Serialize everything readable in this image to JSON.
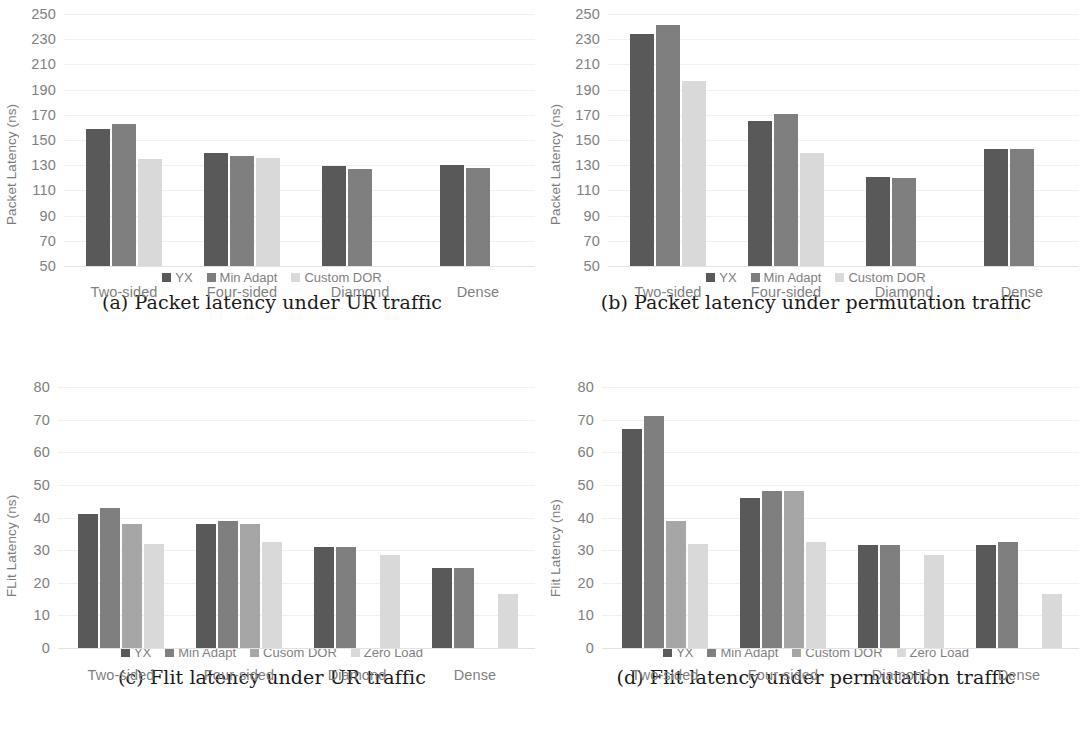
{
  "colors": {
    "yx": "#595959",
    "min_adapt": "#7f7f7f",
    "custom_dor": "#d9d9d9",
    "zero_load": "#d9d9d9",
    "cusom_dor_c": "#a6a6a6",
    "custom_dor_d": "#a6a6a6",
    "grid": "#f0f0f0",
    "tick_text": "#808080",
    "caption_text": "#1a1a1a"
  },
  "panels": [
    {
      "id": "panel-a",
      "caption": "(a) Packet latency under UR traffic",
      "chart_data": {
        "type": "bar",
        "title": "",
        "xlabel": "",
        "ylabel": "Packet Latency (ns)",
        "ylim": [
          50,
          250
        ],
        "ytick_step": 20,
        "yticks": [
          250,
          230,
          210,
          190,
          170,
          150,
          130,
          110,
          90,
          70,
          50
        ],
        "grid": true,
        "legend_position": "bottom",
        "categories": [
          "Two-sided",
          "Four-sided",
          "Diamond",
          "Dense"
        ],
        "series": [
          {
            "name": "YX",
            "color": "#595959",
            "values": [
              159,
              140,
              129,
              130
            ]
          },
          {
            "name": "Min Adapt",
            "color": "#7f7f7f",
            "values": [
              163,
              137,
              127,
              128
            ]
          },
          {
            "name": "Custom DOR",
            "color": "#d9d9d9",
            "values": [
              135,
              136,
              null,
              null
            ]
          }
        ]
      }
    },
    {
      "id": "panel-b",
      "caption": "(b) Packet latency under permutation traffic",
      "chart_data": {
        "type": "bar",
        "title": "",
        "xlabel": "",
        "ylabel": "Packet Latency (ns)",
        "ylim": [
          50,
          250
        ],
        "ytick_step": 20,
        "yticks": [
          250,
          230,
          210,
          190,
          170,
          150,
          130,
          110,
          90,
          70,
          50
        ],
        "grid": true,
        "legend_position": "bottom",
        "categories": [
          "Two-sided",
          "Four-sided",
          "Diamond",
          "Dense"
        ],
        "series": [
          {
            "name": "YX",
            "color": "#595959",
            "values": [
              234,
              165,
              121,
              143
            ]
          },
          {
            "name": "Min Adapt",
            "color": "#7f7f7f",
            "values": [
              241,
              171,
              120,
              143
            ]
          },
          {
            "name": "Custom DOR",
            "color": "#d9d9d9",
            "values": [
              197,
              140,
              null,
              null
            ]
          }
        ]
      }
    },
    {
      "id": "panel-c",
      "caption": "(c) Flit latency under UR traffic",
      "chart_data": {
        "type": "bar",
        "title": "",
        "xlabel": "",
        "ylabel": "FLit Latency (ns)",
        "ylim": [
          0,
          80
        ],
        "ytick_step": 10,
        "yticks": [
          80,
          70,
          60,
          50,
          40,
          30,
          20,
          10,
          0
        ],
        "grid": true,
        "legend_position": "bottom",
        "categories": [
          "Two-sided",
          "Four-sided",
          "Diamond",
          "Dense"
        ],
        "series": [
          {
            "name": "YX",
            "color": "#595959",
            "values": [
              41,
              38,
              31,
              24.5
            ]
          },
          {
            "name": "Min Adapt",
            "color": "#7f7f7f",
            "values": [
              43,
              39,
              31,
              24.5
            ]
          },
          {
            "name": "Cusom DOR",
            "color": "#a6a6a6",
            "values": [
              38,
              38,
              null,
              null
            ]
          },
          {
            "name": "Zero Load",
            "color": "#d9d9d9",
            "values": [
              32,
              32.5,
              28.5,
              16.5
            ]
          }
        ]
      }
    },
    {
      "id": "panel-d",
      "caption": "(d) Flit latency under permutation traffic",
      "chart_data": {
        "type": "bar",
        "title": "",
        "xlabel": "",
        "ylabel": "Flit Latency (ns)",
        "ylim": [
          0,
          80
        ],
        "ytick_step": 10,
        "yticks": [
          80,
          70,
          60,
          50,
          40,
          30,
          20,
          10,
          0
        ],
        "grid": true,
        "legend_position": "bottom",
        "categories": [
          "Two-sided",
          "Four-sided",
          "Diamond",
          "Dense"
        ],
        "series": [
          {
            "name": "YX",
            "color": "#595959",
            "values": [
              67,
              46,
              31.5,
              31.5
            ]
          },
          {
            "name": "Min Adapt",
            "color": "#7f7f7f",
            "values": [
              71,
              48,
              31.5,
              32.5
            ]
          },
          {
            "name": "Custom DOR",
            "color": "#a6a6a6",
            "values": [
              39,
              48,
              null,
              null
            ]
          },
          {
            "name": "Zero Load",
            "color": "#d9d9d9",
            "values": [
              32,
              32.5,
              28.5,
              16.5
            ]
          }
        ]
      }
    }
  ]
}
